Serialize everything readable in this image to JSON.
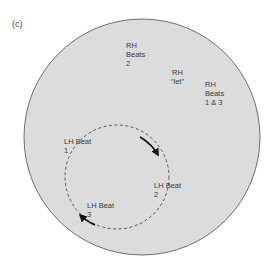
{
  "panel_label": "(c)",
  "colors": {
    "disk_fill": "#dcdcdc",
    "disk_stroke": "#6e6e6e",
    "dash_stroke": "#555555",
    "arrow": "#111111",
    "text": "#3a3a3a"
  },
  "labels": {
    "rh_beats_2": "RH\nBeats\n2",
    "rh_let": "RH\n“let”",
    "rh_beats_1_3": "RH\nBeats\n1 & 3",
    "lh_beat_1": "LH Beat\n1",
    "lh_beat_2": "LH Beat\n2",
    "lh_beat_3": "LH Beat\n3"
  },
  "icons": {
    "arrow_clockwise": "arrowhead",
    "arrow_return": "arrowhead"
  }
}
